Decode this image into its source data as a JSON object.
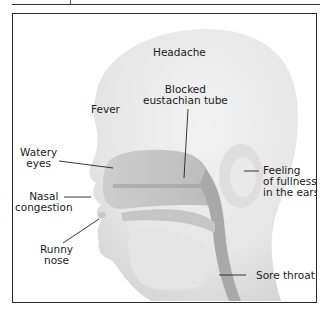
{
  "figure": {
    "caption_fragment": "",
    "colors": {
      "frame_border": "#2a2a2a",
      "head_fill": "#e9e9e9",
      "cavity_fill": "#bdbdbd",
      "leader_line": "#222222"
    }
  },
  "labels": {
    "headache": "Headache",
    "eustachian_line1": "Blocked",
    "eustachian_line2": "eustachian tube",
    "fever": "Fever",
    "watery_line1": "Watery",
    "watery_line2": "eyes",
    "nasal_line1": "Nasal",
    "nasal_line2": "congestion",
    "runny_line1": "Runny",
    "runny_line2": "nose",
    "ears_line1": "Feeling",
    "ears_line2": "of fullness",
    "ears_line3": "in the ears",
    "sore_throat": "Sore throat"
  }
}
